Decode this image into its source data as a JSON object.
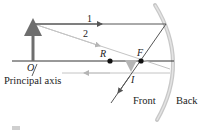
{
  "diagram": {
    "labels": {
      "ray1": "1",
      "ray2": "2",
      "object_base": "O",
      "axis": "Principal axis",
      "center": "R",
      "focal": "F",
      "image": "I",
      "front": "Front",
      "back": "Back"
    },
    "colors": {
      "axis": "#333333",
      "object": "#6e6e6e",
      "ray_dark": "#555555",
      "ray_light": "#bdbdbd",
      "mirror": "#c8c8c8",
      "points": "#111111"
    }
  }
}
